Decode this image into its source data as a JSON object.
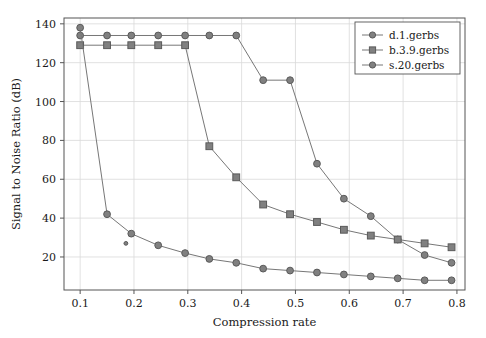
{
  "chart_data": {
    "type": "line",
    "title": "",
    "xlabel": "Compression rate",
    "ylabel": "Signal to Noise Ratio (dB)",
    "xlim": [
      0.07,
      0.815
    ],
    "ylim": [
      3,
      143
    ],
    "xticks": [
      0.1,
      0.2,
      0.3,
      0.4,
      0.5,
      0.6,
      0.7,
      0.8
    ],
    "xticklabels": [
      "0.1",
      "0.2",
      "0.3",
      "0.4",
      "0.5",
      "0.6",
      "0.7",
      "0.8"
    ],
    "yticks": [
      20,
      40,
      60,
      80,
      100,
      120,
      140
    ],
    "yticklabels": [
      "20",
      "40",
      "60",
      "80",
      "100",
      "120",
      "140"
    ],
    "grid": true,
    "legend_position": "upper-right",
    "series": [
      {
        "name": "d.1.gerbs",
        "marker": "circle",
        "color": "#808080",
        "line_color": "#777777",
        "points": [
          {
            "x": 0.1,
            "y": 134
          },
          {
            "x": 0.15,
            "y": 134
          },
          {
            "x": 0.195,
            "y": 134
          },
          {
            "x": 0.245,
            "y": 134
          },
          {
            "x": 0.295,
            "y": 134
          },
          {
            "x": 0.34,
            "y": 134
          },
          {
            "x": 0.39,
            "y": 134
          },
          {
            "x": 0.44,
            "y": 111
          },
          {
            "x": 0.49,
            "y": 111
          },
          {
            "x": 0.54,
            "y": 68
          },
          {
            "x": 0.59,
            "y": 50
          },
          {
            "x": 0.64,
            "y": 41
          },
          {
            "x": 0.69,
            "y": 29
          },
          {
            "x": 0.74,
            "y": 21
          },
          {
            "x": 0.79,
            "y": 17
          }
        ]
      },
      {
        "name": "b.3.9.gerbs",
        "marker": "square",
        "color": "#808080",
        "line_color": "#777777",
        "points": [
          {
            "x": 0.1,
            "y": 129
          },
          {
            "x": 0.15,
            "y": 129
          },
          {
            "x": 0.195,
            "y": 129
          },
          {
            "x": 0.245,
            "y": 129
          },
          {
            "x": 0.295,
            "y": 129
          },
          {
            "x": 0.34,
            "y": 77
          },
          {
            "x": 0.39,
            "y": 61
          },
          {
            "x": 0.44,
            "y": 47
          },
          {
            "x": 0.49,
            "y": 42
          },
          {
            "x": 0.54,
            "y": 38
          },
          {
            "x": 0.59,
            "y": 34
          },
          {
            "x": 0.64,
            "y": 31
          },
          {
            "x": 0.69,
            "y": 29
          },
          {
            "x": 0.74,
            "y": 27
          },
          {
            "x": 0.79,
            "y": 25
          }
        ]
      },
      {
        "name": "s.20.gerbs",
        "marker": "circle",
        "color": "#808080",
        "line_color": "#777777",
        "points": [
          {
            "x": 0.1,
            "y": 138
          },
          {
            "x": 0.15,
            "y": 42
          },
          {
            "x": 0.195,
            "y": 32
          },
          {
            "x": 0.245,
            "y": 26
          },
          {
            "x": 0.295,
            "y": 22
          },
          {
            "x": 0.34,
            "y": 19
          },
          {
            "x": 0.39,
            "y": 17
          },
          {
            "x": 0.44,
            "y": 14
          },
          {
            "x": 0.49,
            "y": 13
          },
          {
            "x": 0.54,
            "y": 12
          },
          {
            "x": 0.59,
            "y": 11
          },
          {
            "x": 0.64,
            "y": 10
          },
          {
            "x": 0.69,
            "y": 9
          },
          {
            "x": 0.74,
            "y": 8
          },
          {
            "x": 0.79,
            "y": 8
          }
        ],
        "outliers": [
          {
            "x": 0.185,
            "y": 27
          }
        ]
      }
    ]
  },
  "legend": {
    "entries": [
      {
        "label": "d.1.gerbs",
        "marker": "circle"
      },
      {
        "label": "b.3.9.gerbs",
        "marker": "square"
      },
      {
        "label": "s.20.gerbs",
        "marker": "circle"
      }
    ]
  },
  "colors": {
    "marker_fill": "#808080",
    "marker_stroke": "#5a5a5a",
    "line": "#777777",
    "grid": "#d9d9d9",
    "axis": "#555555",
    "background": "#ffffff"
  }
}
